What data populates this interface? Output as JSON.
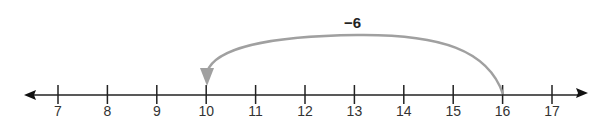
{
  "number_line": {
    "min": 7,
    "max": 17,
    "ticks": [
      "7",
      "8",
      "9",
      "10",
      "11",
      "12",
      "13",
      "14",
      "15",
      "16",
      "17"
    ],
    "line_color": "#222222",
    "arrows": "both"
  },
  "jump": {
    "label": "−6",
    "from": 16,
    "to": 10,
    "direction": "left",
    "color": "#a0a0a0"
  }
}
